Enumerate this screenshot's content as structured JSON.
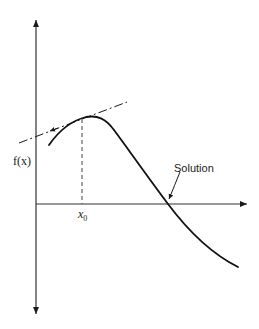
{
  "figure": {
    "type": "diagram",
    "y_axis_label": "f(x)",
    "x_marker_label": "x",
    "x_marker_subscript": "0",
    "root_label": "Solution",
    "colors": {
      "ink": "#1a1a1a",
      "background": "#ffffff",
      "dashed": "#555555"
    }
  },
  "elements": {
    "y_axis": {
      "x": 36,
      "y_top": 18,
      "y_bottom": 316,
      "arrows": "both"
    },
    "x_axis": {
      "y": 204,
      "x_start": 36,
      "x_end": 248,
      "arrow": "right"
    },
    "curve_points": [
      [
        49,
        145
      ],
      [
        60,
        131
      ],
      [
        72,
        122
      ],
      [
        88,
        117
      ],
      [
        100,
        118
      ],
      [
        112,
        128
      ],
      [
        124,
        145
      ],
      [
        138,
        165
      ],
      [
        152,
        184
      ],
      [
        168,
        204
      ],
      [
        185,
        225
      ],
      [
        205,
        245
      ],
      [
        222,
        258
      ],
      [
        238,
        267
      ]
    ],
    "tangent_line": {
      "from": [
        19,
        143
      ],
      "to": [
        127,
        102
      ],
      "style": "dash-dot",
      "arrow_at": [
        50,
        131
      ],
      "arrow_direction": "left-down"
    },
    "x0_dashed_line": {
      "x": 82,
      "y_top": 119,
      "y_bottom": 204
    },
    "solution_leader": {
      "from": [
        180,
        172
      ],
      "to": [
        169,
        199
      ]
    }
  }
}
